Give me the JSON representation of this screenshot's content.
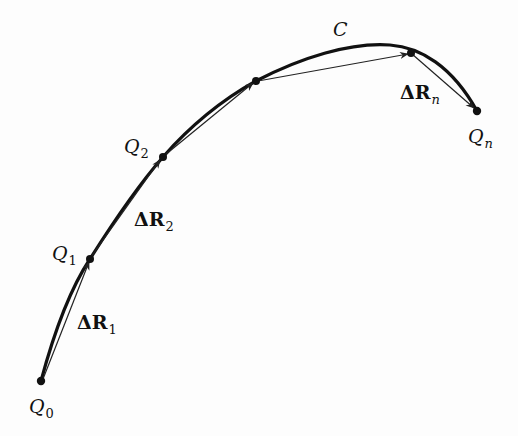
{
  "figure": {
    "curve_label": "C",
    "points": [
      {
        "id": "Q0",
        "name": "Q",
        "sub": "0",
        "x": 41,
        "y": 381
      },
      {
        "id": "Q1",
        "name": "Q",
        "sub": "1",
        "x": 90,
        "y": 259
      },
      {
        "id": "Q2",
        "name": "Q",
        "sub": "2",
        "x": 163,
        "y": 157
      },
      {
        "id": "P3",
        "name": "",
        "sub": "",
        "x": 256,
        "y": 81
      },
      {
        "id": "P4",
        "name": "",
        "sub": "",
        "x": 411,
        "y": 53
      },
      {
        "id": "Qn",
        "name": "Q",
        "sub": "n",
        "x": 477,
        "y": 111
      }
    ],
    "vectors": [
      {
        "name": "ΔR",
        "sub": "1"
      },
      {
        "name": "ΔR",
        "sub": "2"
      },
      {
        "name": "ΔR",
        "sub": "n"
      }
    ],
    "colors": {
      "curve": "#111111",
      "vector": "#222222",
      "background": "#fdfdfd"
    }
  }
}
